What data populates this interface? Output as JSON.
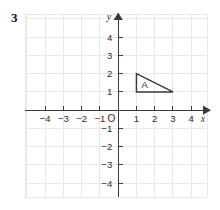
{
  "problem": {
    "number": "3"
  },
  "colors": {
    "background": "#ffffff",
    "grid": "#e6e6e6",
    "axis": "#3a3a3a",
    "text": "#2b2b2b",
    "shape_stroke": "#3a3a3a",
    "shape_fill": "none"
  },
  "chart_data": {
    "type": "scatter",
    "title": "",
    "xlabel": "x",
    "ylabel": "y",
    "xlim": [
      -5,
      5
    ],
    "ylim": [
      -5,
      5
    ],
    "grid": true,
    "legend": "none",
    "origin_label": "O",
    "x_ticks": [
      -4,
      -3,
      -2,
      -1,
      1,
      2,
      3,
      4
    ],
    "x_tick_labels": [
      "−4",
      "−3",
      "−2",
      "−1",
      "1",
      "2",
      "3",
      "4"
    ],
    "y_ticks": [
      4,
      3,
      2,
      1,
      -1,
      -2,
      -3,
      -4
    ],
    "y_tick_labels": [
      "4",
      "3",
      "2",
      "1",
      "−1",
      "−2",
      "−3",
      "−4"
    ],
    "axis_arrows": [
      "x-positive",
      "y-positive"
    ],
    "shapes": [
      {
        "name": "triangle-a",
        "label": "A",
        "type": "polygon",
        "vertices": [
          [
            1,
            2
          ],
          [
            1,
            1
          ],
          [
            3,
            1
          ]
        ],
        "label_position": [
          1.45,
          1.42
        ]
      }
    ]
  }
}
